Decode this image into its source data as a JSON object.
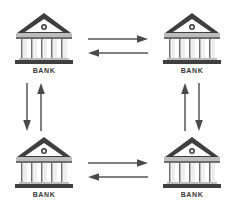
{
  "diagram": {
    "type": "node-link-diagram",
    "canvas": {
      "width": 235,
      "height": 211,
      "background": "#ffffff"
    },
    "colors": {
      "building_dark": "#3f3f3f",
      "building_mid": "#6e6e6e",
      "building_light": "#c9c9c9",
      "column_light": "#efefef",
      "label_text": "#3a3a3a",
      "arrow": "#4a4a4a"
    },
    "nodes": [
      {
        "id": "bank-top-left",
        "label": "BANK",
        "position": "top-left",
        "icon": "bank-building-icon",
        "columns": 5,
        "x": 13,
        "y": 10
      },
      {
        "id": "bank-top-right",
        "label": "BANK",
        "position": "top-right",
        "icon": "bank-building-icon",
        "columns": 5,
        "x": 161,
        "y": 10
      },
      {
        "id": "bank-bottom-left",
        "label": "BANK",
        "position": "bottom-left",
        "icon": "bank-building-icon",
        "columns": 5,
        "x": 13,
        "y": 134
      },
      {
        "id": "bank-bottom-right",
        "label": "BANK",
        "position": "bottom-right",
        "icon": "bank-building-icon",
        "columns": 5,
        "x": 161,
        "y": 134
      }
    ],
    "connectors": [
      {
        "id": "top-horizontal-pair",
        "orientation": "horizontal",
        "between": [
          "bank-top-left",
          "bank-top-right"
        ],
        "arrows": [
          {
            "icon": "arrow-right-icon",
            "direction": "right"
          },
          {
            "icon": "arrow-left-icon",
            "direction": "left"
          }
        ]
      },
      {
        "id": "bottom-horizontal-pair",
        "orientation": "horizontal",
        "between": [
          "bank-bottom-left",
          "bank-bottom-right"
        ],
        "arrows": [
          {
            "icon": "arrow-right-icon",
            "direction": "right"
          },
          {
            "icon": "arrow-left-icon",
            "direction": "left"
          }
        ]
      },
      {
        "id": "left-vertical-pair",
        "orientation": "vertical",
        "between": [
          "bank-top-left",
          "bank-bottom-left"
        ],
        "arrows": [
          {
            "icon": "arrow-down-icon",
            "direction": "down"
          },
          {
            "icon": "arrow-up-icon",
            "direction": "up"
          }
        ]
      },
      {
        "id": "right-vertical-pair",
        "orientation": "vertical",
        "between": [
          "bank-top-right",
          "bank-bottom-right"
        ],
        "arrows": [
          {
            "icon": "arrow-up-icon",
            "direction": "up"
          },
          {
            "icon": "arrow-down-icon",
            "direction": "down"
          }
        ]
      }
    ]
  }
}
